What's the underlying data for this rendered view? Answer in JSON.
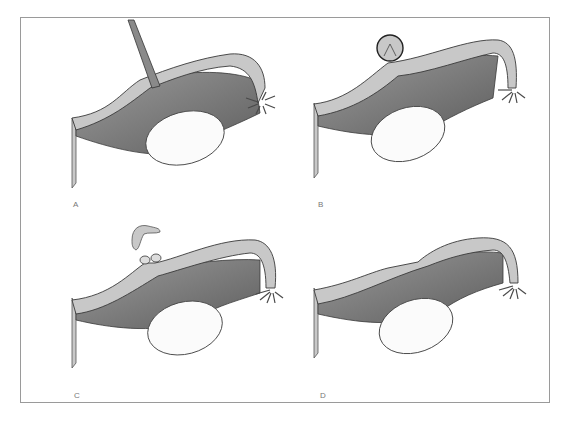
{
  "figure": {
    "colors": {
      "frame": "#9a9a9a",
      "tube_wall": "#c8c8c8",
      "tube_outline": "#4a4a4a",
      "mesosalpinx": "#7a7a7a",
      "ovary": "#fbfbfb",
      "fimbria": "#5a5a5a",
      "label": "#777777"
    },
    "panels": [
      {
        "id": "A",
        "label": "A",
        "caption": "Tube grasped by instrument at isthmus"
      },
      {
        "id": "B",
        "label": "B",
        "caption": "Loop of tube lifted and ligated"
      },
      {
        "id": "C",
        "label": "C",
        "caption": "Ligated loop excised"
      },
      {
        "id": "D",
        "label": "D",
        "caption": "Healed tube with separated ends"
      }
    ]
  }
}
